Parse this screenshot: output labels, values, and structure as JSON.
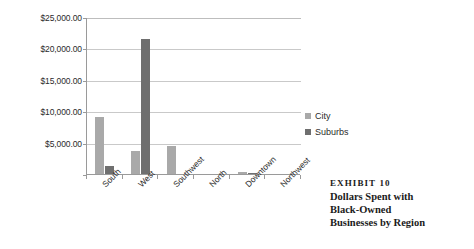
{
  "chart_data": {
    "type": "bar",
    "title": "",
    "xlabel": "",
    "ylabel": "",
    "grid": true,
    "legend_position": "right",
    "ylim": [
      0,
      25000
    ],
    "yticks": [
      5000,
      10000,
      15000,
      20000,
      25000
    ],
    "ytick_labels": [
      "$5,000.00",
      "$10,000.00",
      "$15,000.00",
      "$20,000.00",
      "$25,000.00"
    ],
    "categories": [
      "South",
      "West",
      "Southwest",
      "North",
      "Downtown",
      "Northwest"
    ],
    "series": [
      {
        "name": "City",
        "color": "#a9a9a9",
        "values": [
          9000,
          3600,
          4400,
          0,
          250,
          0
        ]
      },
      {
        "name": "Suburbs",
        "color": "#6f6f6f",
        "values": [
          1200,
          21500,
          0,
          0,
          180,
          0
        ]
      }
    ]
  },
  "legend": {
    "items": [
      {
        "label": "City",
        "color": "#a9a9a9"
      },
      {
        "label": "Suburbs",
        "color": "#6f6f6f"
      }
    ]
  },
  "caption": {
    "exhibit": "EXHIBIT 10",
    "lines": [
      "Dollars Spent with",
      "Black-Owned",
      "Businesses by Region"
    ]
  }
}
